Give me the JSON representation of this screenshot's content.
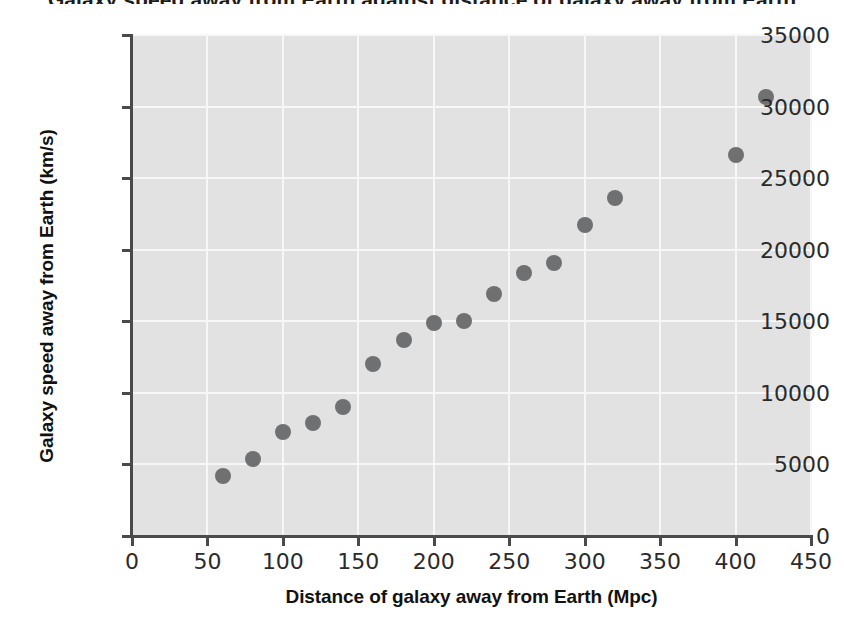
{
  "figure": {
    "title_partial": "Galaxy speed away from Earth against distance of galaxy away from Earth"
  },
  "ghost_text": {
    "lines": [
      "a problem sheet: a galaxy's recessional velocity",
      "is very easy. However, measuring its distance away",
      "is much more difficult, and is a source of uncertainty",
      "the Big Bang theory of the Universe"
    ]
  },
  "chart_data": {
    "type": "scatter",
    "title": "Galaxy speed away from Earth against distance of galaxy away from Earth",
    "xlabel": "Distance of galaxy away from Earth (Mpc)",
    "ylabel": "Galaxy speed away from Earth (km/s)",
    "xlim": [
      0,
      450
    ],
    "ylim": [
      0,
      35000
    ],
    "xticks": [
      0,
      50,
      100,
      150,
      200,
      250,
      300,
      350,
      400,
      450
    ],
    "yticks": [
      0,
      5000,
      10000,
      15000,
      20000,
      25000,
      30000,
      35000
    ],
    "xtick_labels": [
      "0",
      "50",
      "100",
      "150",
      "200",
      "250",
      "300",
      "350",
      "400",
      "450"
    ],
    "ytick_labels": [
      "0",
      "5000",
      "10000",
      "15000",
      "20000",
      "25000",
      "30000",
      "35000"
    ],
    "grid": true,
    "legend": false,
    "marker_color": "#6f7072",
    "plot_background": "#e2e2e2",
    "gridline_color": "#f7f7f7",
    "x": [
      60,
      80,
      100,
      120,
      140,
      160,
      180,
      200,
      220,
      240,
      260,
      280,
      300,
      320,
      400,
      420
    ],
    "y": [
      4200,
      5400,
      7300,
      7900,
      9000,
      12000,
      13700,
      14900,
      15000,
      16900,
      18400,
      19100,
      21700,
      23600,
      26600,
      30700
    ],
    "points": [
      {
        "x": 60,
        "y": 4200
      },
      {
        "x": 80,
        "y": 5400
      },
      {
        "x": 100,
        "y": 7300
      },
      {
        "x": 120,
        "y": 7900
      },
      {
        "x": 140,
        "y": 9000
      },
      {
        "x": 160,
        "y": 12000
      },
      {
        "x": 180,
        "y": 13700
      },
      {
        "x": 200,
        "y": 14900
      },
      {
        "x": 220,
        "y": 15000
      },
      {
        "x": 240,
        "y": 16900
      },
      {
        "x": 260,
        "y": 18400
      },
      {
        "x": 280,
        "y": 19100
      },
      {
        "x": 300,
        "y": 21700
      },
      {
        "x": 320,
        "y": 23600
      },
      {
        "x": 400,
        "y": 26600
      },
      {
        "x": 420,
        "y": 30700
      }
    ]
  }
}
